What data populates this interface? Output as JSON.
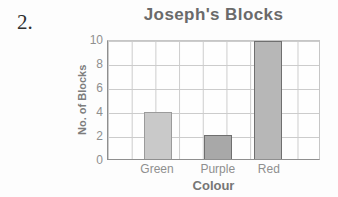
{
  "question_number": "2.",
  "chart_data": {
    "type": "bar",
    "title": "Joseph's Blocks",
    "xlabel": "Colour",
    "ylabel": "No. of Blocks",
    "categories": [
      "Green",
      "Purple",
      "Red"
    ],
    "values": [
      4,
      2,
      10
    ],
    "ylim": [
      0,
      10
    ],
    "yticks": [
      0,
      2,
      4,
      6,
      8,
      10
    ],
    "grid": true,
    "legend": false,
    "bar_colors": [
      {
        "fill": "#c9c9c9",
        "border": "#9b9b9b"
      },
      {
        "fill": "#a8a8a8",
        "border": "#6f6f6f"
      },
      {
        "fill": "#b7b7b7",
        "border": "#6f6f6f"
      }
    ]
  }
}
